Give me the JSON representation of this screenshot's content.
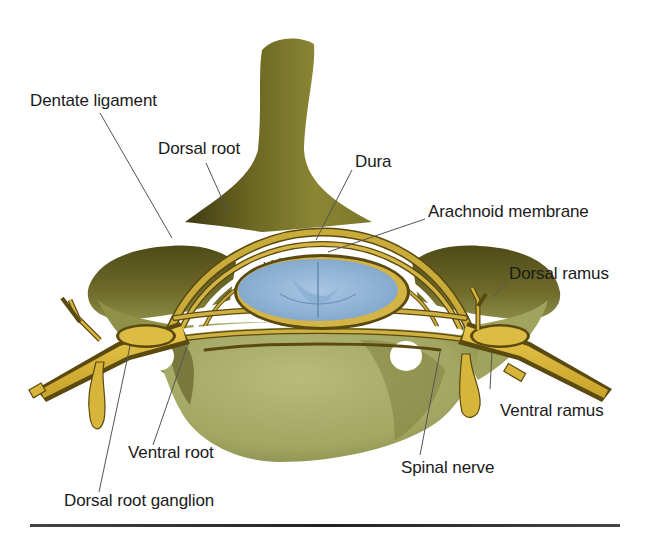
{
  "figure": {
    "colors": {
      "bone_light": "#a9ad6a",
      "bone_mid": "#8a8a3a",
      "bone_dark": "#4e4a1a",
      "nerve": "#d6b53a",
      "nerve_outline": "#5a4a10",
      "cord": "#8fb3d6",
      "cord_dark": "#6f94ba",
      "leader": "#555555"
    }
  },
  "labels": {
    "dentate_ligament": "Dentate ligament",
    "dorsal_root": "Dorsal root",
    "dura": "Dura",
    "arachnoid_membrane": "Arachnoid membrane",
    "dorsal_ramus": "Dorsal ramus",
    "ventral_ramus": "Ventral ramus",
    "ventral_root": "Ventral root",
    "spinal_nerve": "Spinal nerve",
    "dorsal_root_ganglion": "Dorsal root ganglion"
  }
}
